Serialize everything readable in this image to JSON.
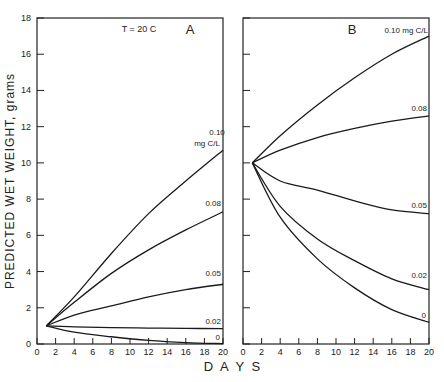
{
  "chart_data": [
    {
      "type": "line",
      "panel": "A",
      "annotation": "T = 20 C",
      "xlabel": "DAYS",
      "ylabel": "PREDICTED WET WEIGHT, grams",
      "xlim": [
        0,
        20
      ],
      "ylim": [
        0,
        18
      ],
      "xticks": [
        0,
        2,
        4,
        6,
        8,
        10,
        12,
        14,
        16,
        18,
        20
      ],
      "yticks": [
        0,
        2,
        4,
        6,
        8,
        10,
        12,
        14,
        16,
        18
      ],
      "series": [
        {
          "name": "0.10 mg C/L",
          "x": [
            1,
            4,
            8,
            12,
            16,
            20
          ],
          "values": [
            1.0,
            2.6,
            5.0,
            7.2,
            9.0,
            10.7
          ]
        },
        {
          "name": "0.08",
          "x": [
            1,
            4,
            8,
            12,
            16,
            20
          ],
          "values": [
            1.0,
            2.3,
            3.9,
            5.2,
            6.3,
            7.3
          ]
        },
        {
          "name": "0.05",
          "x": [
            1,
            4,
            8,
            12,
            16,
            20
          ],
          "values": [
            1.0,
            1.6,
            2.1,
            2.6,
            3.0,
            3.3
          ]
        },
        {
          "name": "0.02",
          "x": [
            1,
            4,
            8,
            12,
            16,
            20
          ],
          "values": [
            1.0,
            0.95,
            0.9,
            0.88,
            0.86,
            0.85
          ]
        },
        {
          "name": "0",
          "x": [
            1,
            4,
            8,
            12,
            16,
            20
          ],
          "values": [
            1.0,
            0.65,
            0.4,
            0.2,
            0.08,
            0.02
          ]
        }
      ]
    },
    {
      "type": "line",
      "panel": "B",
      "xlabel": "DAYS",
      "xlim": [
        0,
        20
      ],
      "ylim": [
        0,
        18
      ],
      "xticks": [
        0,
        2,
        4,
        6,
        8,
        10,
        12,
        14,
        16,
        18,
        20
      ],
      "series": [
        {
          "name": "0.10 mg C/L",
          "x": [
            1,
            4,
            8,
            12,
            16,
            20
          ],
          "values": [
            10.0,
            11.5,
            13.2,
            14.7,
            16.0,
            17.0
          ]
        },
        {
          "name": "0.08",
          "x": [
            1,
            4,
            8,
            12,
            16,
            20
          ],
          "values": [
            10.0,
            10.7,
            11.4,
            11.9,
            12.3,
            12.6
          ]
        },
        {
          "name": "0.05",
          "x": [
            1,
            4,
            8,
            12,
            16,
            20
          ],
          "values": [
            10.0,
            9.0,
            8.5,
            7.9,
            7.4,
            7.2
          ]
        },
        {
          "name": "0.02",
          "x": [
            1,
            4,
            8,
            12,
            16,
            20
          ],
          "values": [
            10.0,
            7.6,
            5.8,
            4.6,
            3.6,
            3.0
          ]
        },
        {
          "name": "0",
          "x": [
            1,
            4,
            8,
            12,
            16,
            20
          ],
          "values": [
            10.0,
            7.0,
            4.7,
            3.1,
            1.9,
            1.2
          ]
        }
      ]
    }
  ],
  "labels": {
    "panel_a": "A",
    "panel_b": "B",
    "temp": "T = 20 C",
    "xlabel": "D A Y S",
    "ylabel": "PREDICTED  WET  WEIGHT,  grams",
    "a_010_line1": "0.10",
    "a_010_line2": "mg C/L",
    "a_008": "0.08",
    "a_005": "0.05",
    "a_002": "0.02",
    "a_0": "0",
    "b_010": "0.10 mg C/L",
    "b_008": "0.08",
    "b_005": "0.05",
    "b_002": "0.02",
    "b_0": "0"
  }
}
